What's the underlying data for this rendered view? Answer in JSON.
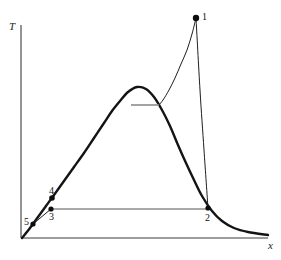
{
  "figure": {
    "kind": "thermodynamic-phase-diagram",
    "background_color": "#ffffff",
    "curve_color": "#141414",
    "thin_line_color": "#1e1e1e",
    "tie_line_color": "#8c8c8c",
    "axis_color": "#3c3c3c",
    "marker_color": "#0d0d0d",
    "width": 281,
    "height": 260
  },
  "axes": {
    "y_label": "T",
    "x_label": "x",
    "y_axis": {
      "x": 21,
      "y_top": 25,
      "y_bottom": 238
    },
    "x_axis": {
      "y": 238,
      "x_left": 21,
      "x_right": 268
    },
    "grid": "off",
    "ticks": "none"
  },
  "labels": {
    "p1": "1",
    "p2": "2",
    "p3": "3",
    "p4": "4",
    "p5": "5"
  },
  "chart_data": {
    "type": "line",
    "title": "",
    "xlabel": "x",
    "ylabel": "T",
    "grid": false,
    "legend": "none",
    "xlim": [
      21,
      268
    ],
    "ylim": [
      238,
      18
    ],
    "series": [
      {
        "name": "coexistence-dome",
        "style": "thick-solid",
        "color": "#141414",
        "points": [
          [
            22,
            238
          ],
          [
            30,
            228
          ],
          [
            38,
            217
          ],
          [
            46,
            206
          ],
          [
            54,
            195
          ],
          [
            64,
            181
          ],
          [
            74,
            167
          ],
          [
            84,
            153
          ],
          [
            94,
            138
          ],
          [
            104,
            123
          ],
          [
            112,
            111
          ],
          [
            120,
            101
          ],
          [
            128,
            92
          ],
          [
            137,
            87
          ],
          [
            146,
            89
          ],
          [
            154,
            97
          ],
          [
            162,
            110
          ],
          [
            170,
            126
          ],
          [
            178,
            145
          ],
          [
            186,
            163
          ],
          [
            194,
            180
          ],
          [
            202,
            196
          ],
          [
            212,
            211
          ],
          [
            222,
            221
          ],
          [
            234,
            228
          ],
          [
            248,
            232
          ],
          [
            268,
            235
          ]
        ]
      },
      {
        "name": "vertical-path-1-to-2",
        "style": "thin-solid",
        "color": "#1e1e1e",
        "points": [
          [
            196,
            18
          ],
          [
            200,
            90
          ],
          [
            204,
            150
          ],
          [
            208,
            208
          ]
        ]
      },
      {
        "name": "curved-path-1-to-tieline",
        "style": "thin-solid",
        "color": "#1e1e1e",
        "points": [
          [
            196,
            18
          ],
          [
            192,
            34
          ],
          [
            187,
            50
          ],
          [
            181,
            64
          ],
          [
            175,
            78
          ],
          [
            169,
            90
          ],
          [
            163,
            100
          ],
          [
            159,
            105
          ]
        ]
      },
      {
        "name": "tie-line-in-dome",
        "style": "thin-solid-gray",
        "color": "#8c8c8c",
        "points": [
          [
            131,
            105
          ],
          [
            159,
            105
          ]
        ]
      },
      {
        "name": "horizontal-line-3-to-2",
        "style": "thin-solid",
        "color": "#555555",
        "points": [
          [
            51,
            209
          ],
          [
            208,
            209
          ]
        ]
      },
      {
        "name": "path-5-to-4",
        "style": "thin-solid",
        "color": "#1e1e1e",
        "points": [
          [
            33,
            224
          ],
          [
            52,
            198
          ]
        ]
      },
      {
        "name": "path-5-to-3",
        "style": "thin-solid",
        "color": "#1e1e1e",
        "points": [
          [
            33,
            224
          ],
          [
            51,
            209
          ]
        ]
      }
    ],
    "markers": [
      {
        "label": "1",
        "x": 196,
        "y": 18,
        "r": 3.2
      },
      {
        "label": "2",
        "x": 208,
        "y": 208,
        "r": 2.6
      },
      {
        "label": "3",
        "x": 51,
        "y": 209,
        "r": 2.6
      },
      {
        "label": "4",
        "x": 52,
        "y": 198,
        "r": 2.8
      },
      {
        "label": "5",
        "x": 33,
        "y": 224,
        "r": 2.6
      }
    ]
  }
}
